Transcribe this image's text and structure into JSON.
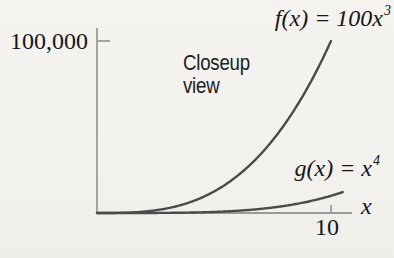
{
  "figure": {
    "background": "#f3f2ee",
    "text_color": "#161616",
    "axis_color": "#9a9a97",
    "curve_color": "#4b4b4b"
  },
  "annotation": {
    "lines": [
      "Closeup",
      "view"
    ]
  },
  "chart_data": {
    "type": "line",
    "title": "Closeup view",
    "xlabel": "x",
    "ylabel": "",
    "xlim": [
      0,
      10.9
    ],
    "ylim": [
      0,
      107500
    ],
    "grid": false,
    "legend": "inline-labels",
    "x_ticks": [
      {
        "value": 10,
        "label": "10"
      }
    ],
    "y_ticks": [
      {
        "value": 100000,
        "label": "100,000"
      }
    ],
    "series": [
      {
        "name": "f",
        "formula": "f(x) = 100x^3",
        "label_base": "f(x) = 100x",
        "label_exp": "3",
        "coefficient": 100,
        "power": 3,
        "color": "#4b4b4b",
        "x": [
          0,
          1,
          2,
          3,
          4,
          5,
          6,
          7,
          8,
          9,
          10
        ],
        "y": [
          0,
          100,
          800,
          2700,
          6400,
          12500,
          21600,
          34300,
          51200,
          72900,
          100000
        ]
      },
      {
        "name": "g",
        "formula": "g(x) = x^4",
        "label_base": "g(x) = x",
        "label_exp": "4",
        "coefficient": 1,
        "power": 4,
        "color": "#4b4b4b",
        "x": [
          0,
          1,
          2,
          3,
          4,
          5,
          6,
          7,
          8,
          9,
          10,
          10.5
        ],
        "y": [
          0,
          1,
          16,
          81,
          256,
          625,
          1296,
          2401,
          4096,
          6561,
          10000,
          12155
        ]
      }
    ]
  }
}
